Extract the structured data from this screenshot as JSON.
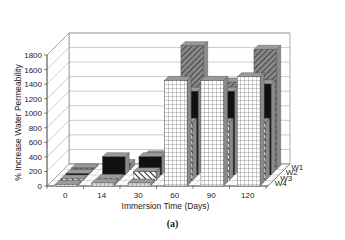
{
  "chart_data": {
    "type": "bar",
    "subtype": "3d-grouped-bar",
    "title": "",
    "caption": "(a)",
    "xlabel": "Immersion Time (Days)",
    "ylabel": "% Increase Water Permeability",
    "ylim": [
      0,
      1800
    ],
    "yticks": [
      0,
      200,
      400,
      600,
      800,
      1000,
      1200,
      1400,
      1600,
      1800
    ],
    "categories": [
      "0",
      "14",
      "30",
      "60",
      "90",
      "120"
    ],
    "series": [
      {
        "name": "W1",
        "pattern": "dark-diagonal-hatch",
        "values": [
          0,
          80,
          200,
          1700,
          1200,
          1650
        ]
      },
      {
        "name": "W2",
        "pattern": "solid-black",
        "values": [
          0,
          250,
          250,
          1150,
          1150,
          1250
        ]
      },
      {
        "name": "W3",
        "pattern": "light-diagonal-stripe",
        "values": [
          0,
          30,
          120,
          800,
          800,
          800
        ]
      },
      {
        "name": "W4",
        "pattern": "white-grid",
        "values": [
          0,
          40,
          40,
          1450,
          1450,
          1500
        ]
      }
    ],
    "grid": true,
    "legend_position": "depth-axis-right"
  },
  "axis": {
    "ylabel": "% Increase Water Permeability",
    "xlabel": "Immersion Time (Days)"
  },
  "caption": "(a)"
}
